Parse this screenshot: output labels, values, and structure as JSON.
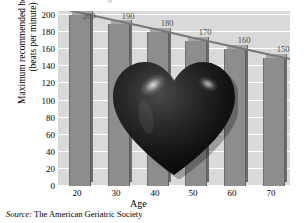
{
  "chart_data": {
    "type": "bar",
    "title": "",
    "xlabel": "Age",
    "ylabel": "Maximum recommended heart rate (beats per minute)",
    "ylabel_line1": "Maximum recommended heart rate",
    "ylabel_line2": "(beats per minute)",
    "categories": [
      "20",
      "30",
      "40",
      "50",
      "60",
      "70"
    ],
    "values": [
      200,
      190,
      180,
      170,
      160,
      150
    ],
    "data_labels": [
      "200",
      "190",
      "180",
      "170",
      "160",
      "150"
    ],
    "ylim": [
      0,
      200
    ],
    "y_ticks": [
      0,
      20,
      40,
      60,
      80,
      100,
      120,
      140,
      160,
      180,
      200
    ],
    "y_tick_labels": [
      "0",
      "20",
      "40",
      "60",
      "80",
      "100",
      "120",
      "140",
      "160",
      "180",
      "200"
    ],
    "grid": true,
    "grid_axis": "y",
    "legend": false,
    "bar_color": "#8d8d8d",
    "plot_background": "#d9d9d9",
    "gridline_color": "#ffffff",
    "three_d": true,
    "overlay_graphic": "heart-graphic"
  },
  "source": {
    "label": "Source:",
    "text": "The American Geriatric Society"
  },
  "clipped_top": {
    "text": "0"
  }
}
